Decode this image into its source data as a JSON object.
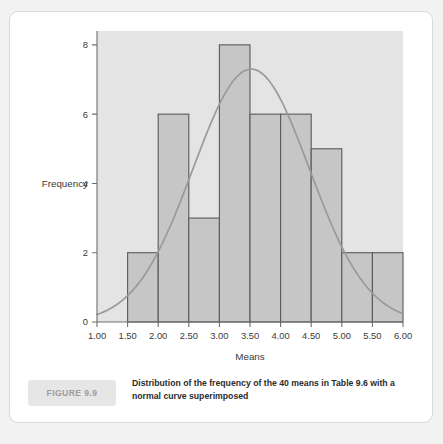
{
  "chart_data": {
    "type": "bar",
    "title": "",
    "subtitle": "",
    "xlabel": "Means",
    "ylabel": "Frequency",
    "categories": [
      "1.50-2.00",
      "2.00-2.50",
      "2.50-3.00",
      "3.00-3.50",
      "3.50-4.00",
      "4.00-4.50",
      "4.50-5.00",
      "5.00-5.50",
      "5.50-6.00"
    ],
    "bin_edges": [
      1.5,
      2.0,
      2.5,
      3.0,
      3.5,
      4.0,
      4.5,
      5.0,
      5.5,
      6.0
    ],
    "values": [
      2,
      6,
      3,
      8,
      6,
      6,
      5,
      2,
      2
    ],
    "total_count": 40,
    "xlim": [
      1.0,
      6.0
    ],
    "ylim": [
      0,
      8.4
    ],
    "xticks": [
      "1.00",
      "1.50",
      "2.00",
      "2.50",
      "3.00",
      "3.50",
      "4.00",
      "4.50",
      "5.00",
      "5.50",
      "6.00"
    ],
    "xtick_values": [
      1.0,
      1.5,
      2.0,
      2.5,
      3.0,
      3.5,
      4.0,
      4.5,
      5.0,
      5.5,
      6.0
    ],
    "yticks": [
      "0",
      "2",
      "4",
      "6",
      "8"
    ],
    "ytick_values": [
      0,
      2,
      4,
      6,
      8
    ],
    "grid": false,
    "legend": false,
    "overlay": {
      "name": "normal curve",
      "type": "line",
      "mean": 3.52,
      "sigma": 0.95,
      "peak": 7.3,
      "start_value": 0.8,
      "end_value": 0.45
    },
    "colors": {
      "bar_fill": "#c6c6c6",
      "bar_stroke": "#5a5a5a",
      "panel_background": "#e4e4e4",
      "curve": "#9a9a9a",
      "axis": "#6e6e6e",
      "card_background": "#ffffff",
      "page_background": "#f2f2f2"
    }
  },
  "figure": {
    "badge_label": "FIGURE 9.9",
    "caption": "Distribution of the frequency of the 40 means in Table 9.6 with a normal curve superimposed"
  }
}
